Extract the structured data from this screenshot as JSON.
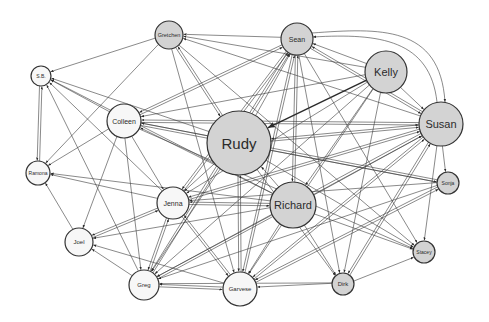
{
  "graph": {
    "type": "directed-network",
    "colors": {
      "grey_fill": "#d3d3d3",
      "white_fill": "#f7f7f7",
      "stroke": "#333333",
      "edge": "#3a3a3a"
    },
    "nodes": [
      {
        "id": "gretchen",
        "label": "Gretchen",
        "x": 169,
        "y": 35,
        "r": 14,
        "fill": "grey",
        "font": 5.5
      },
      {
        "id": "sb",
        "label": "S.B.",
        "x": 41,
        "y": 76,
        "r": 10,
        "fill": "white",
        "font": 5
      },
      {
        "id": "colleen",
        "label": "Colleen",
        "x": 124,
        "y": 121,
        "r": 17,
        "fill": "white",
        "font": 7
      },
      {
        "id": "rudy",
        "label": "Rudy",
        "x": 239,
        "y": 143,
        "r": 32,
        "fill": "grey",
        "font": 15
      },
      {
        "id": "sean",
        "label": "Sean",
        "x": 297,
        "y": 39,
        "r": 16,
        "fill": "grey",
        "font": 7
      },
      {
        "id": "kelly",
        "label": "Kelly",
        "x": 386,
        "y": 72,
        "r": 21,
        "fill": "grey",
        "font": 11
      },
      {
        "id": "susan",
        "label": "Susan",
        "x": 441,
        "y": 124,
        "r": 22,
        "fill": "grey",
        "font": 11
      },
      {
        "id": "ramona",
        "label": "Ramona",
        "x": 38,
        "y": 173,
        "r": 12,
        "fill": "white",
        "font": 5
      },
      {
        "id": "jenna",
        "label": "Jenna",
        "x": 173,
        "y": 203,
        "r": 16,
        "fill": "white",
        "font": 7
      },
      {
        "id": "richard",
        "label": "Richard",
        "x": 293,
        "y": 205,
        "r": 23,
        "fill": "grey",
        "font": 11
      },
      {
        "id": "sonja",
        "label": "Sonja",
        "x": 448,
        "y": 183,
        "r": 11,
        "fill": "grey",
        "font": 5
      },
      {
        "id": "stacey",
        "label": "Stacey",
        "x": 424,
        "y": 252,
        "r": 11,
        "fill": "grey",
        "font": 5
      },
      {
        "id": "joel",
        "label": "Joel",
        "x": 79,
        "y": 242,
        "r": 14,
        "fill": "white",
        "font": 6
      },
      {
        "id": "greg",
        "label": "Greg",
        "x": 144,
        "y": 285,
        "r": 15,
        "fill": "white",
        "font": 6
      },
      {
        "id": "garvese",
        "label": "Garvese",
        "x": 240,
        "y": 289,
        "r": 17,
        "fill": "white",
        "font": 6
      },
      {
        "id": "dirk",
        "label": "Dirk",
        "x": 343,
        "y": 284,
        "r": 11,
        "fill": "grey",
        "font": 6
      }
    ],
    "edges": [
      [
        "gretchen",
        "sb"
      ],
      [
        "gretchen",
        "rudy"
      ],
      [
        "gretchen",
        "ramona"
      ],
      [
        "gretchen",
        "garvese"
      ],
      [
        "sean",
        "gretchen"
      ],
      [
        "kelly",
        "gretchen"
      ],
      [
        "susan",
        "gretchen"
      ],
      [
        "rudy",
        "gretchen"
      ],
      [
        "colleen",
        "sb"
      ],
      [
        "colleen",
        "ramona"
      ],
      [
        "colleen",
        "joel"
      ],
      [
        "colleen",
        "jenna"
      ],
      [
        "colleen",
        "greg"
      ],
      [
        "colleen",
        "stacey"
      ],
      [
        "sean",
        "colleen"
      ],
      [
        "kelly",
        "colleen"
      ],
      [
        "susan",
        "colleen"
      ],
      [
        "richard",
        "colleen"
      ],
      [
        "sonja",
        "colleen"
      ],
      [
        "rudy",
        "colleen"
      ],
      [
        "jenna",
        "sb"
      ],
      [
        "rudy",
        "sb"
      ],
      [
        "richard",
        "sb"
      ],
      [
        "greg",
        "sb"
      ],
      [
        "ramona",
        "sb"
      ],
      [
        "sb",
        "ramona"
      ],
      [
        "jenna",
        "ramona"
      ],
      [
        "joel",
        "ramona"
      ],
      [
        "richard",
        "ramona"
      ],
      [
        "kelly",
        "rudy"
      ],
      [
        "rudy",
        "sean"
      ],
      [
        "rudy",
        "sonja"
      ],
      [
        "rudy",
        "stacey"
      ],
      [
        "rudy",
        "garvese"
      ],
      [
        "rudy",
        "greg"
      ],
      [
        "rudy",
        "jenna"
      ],
      [
        "rudy",
        "dirk"
      ],
      [
        "susan",
        "rudy"
      ],
      [
        "richard",
        "rudy"
      ],
      [
        "garvese",
        "rudy"
      ],
      [
        "kelly",
        "sean"
      ],
      [
        "jenna",
        "sean"
      ],
      [
        "greg",
        "sean"
      ],
      [
        "garvese",
        "sean"
      ],
      [
        "richard",
        "sean"
      ],
      [
        "colleen",
        "sean"
      ],
      [
        "sean",
        "susan"
      ],
      [
        "susan",
        "sean"
      ],
      [
        "kelly",
        "susan"
      ],
      [
        "jenna",
        "susan"
      ],
      [
        "greg",
        "susan"
      ],
      [
        "garvese",
        "susan"
      ],
      [
        "richard",
        "susan"
      ],
      [
        "dirk",
        "susan"
      ],
      [
        "rudy",
        "susan"
      ],
      [
        "colleen",
        "susan"
      ],
      [
        "susan",
        "sonja"
      ],
      [
        "susan",
        "stacey"
      ],
      [
        "susan",
        "jenna"
      ],
      [
        "susan",
        "greg"
      ],
      [
        "susan",
        "garvese"
      ],
      [
        "susan",
        "dirk"
      ],
      [
        "kelly",
        "jenna"
      ],
      [
        "kelly",
        "garvese"
      ],
      [
        "kelly",
        "dirk"
      ],
      [
        "kelly",
        "greg"
      ],
      [
        "kelly",
        "richard"
      ],
      [
        "sean",
        "jenna"
      ],
      [
        "sean",
        "garvese"
      ],
      [
        "sean",
        "richard"
      ],
      [
        "sean",
        "stacey"
      ],
      [
        "sean",
        "dirk"
      ],
      [
        "sean",
        "greg"
      ],
      [
        "jenna",
        "joel"
      ],
      [
        "jenna",
        "greg"
      ],
      [
        "jenna",
        "garvese"
      ],
      [
        "jenna",
        "richard"
      ],
      [
        "joel",
        "jenna"
      ],
      [
        "greg",
        "jenna"
      ],
      [
        "garvese",
        "jenna"
      ],
      [
        "richard",
        "jenna"
      ],
      [
        "sonja",
        "jenna"
      ],
      [
        "greg",
        "joel"
      ],
      [
        "garvese",
        "joel"
      ],
      [
        "richard",
        "joel"
      ],
      [
        "richard",
        "greg"
      ],
      [
        "richard",
        "dirk"
      ],
      [
        "richard",
        "stacey"
      ],
      [
        "richard",
        "garvese"
      ],
      [
        "garvese",
        "greg"
      ],
      [
        "dirk",
        "greg"
      ],
      [
        "sonja",
        "greg"
      ],
      [
        "greg",
        "garvese"
      ],
      [
        "dirk",
        "garvese"
      ],
      [
        "sonja",
        "garvese"
      ],
      [
        "dirk",
        "stacey"
      ],
      [
        "garvese",
        "sonja"
      ],
      [
        "colleen",
        "sonja"
      ],
      [
        "gretchen",
        "stacey"
      ]
    ],
    "curved_edges": [
      {
        "from": "sean",
        "to": "susan",
        "path": "M312,33 C380,28 440,25 445,102"
      },
      {
        "from": "susan",
        "to": "sean",
        "path": "M437,102 C430,40 380,33 313,37"
      }
    ],
    "thick_edges": [
      [
        "kelly",
        "rudy"
      ]
    ]
  }
}
